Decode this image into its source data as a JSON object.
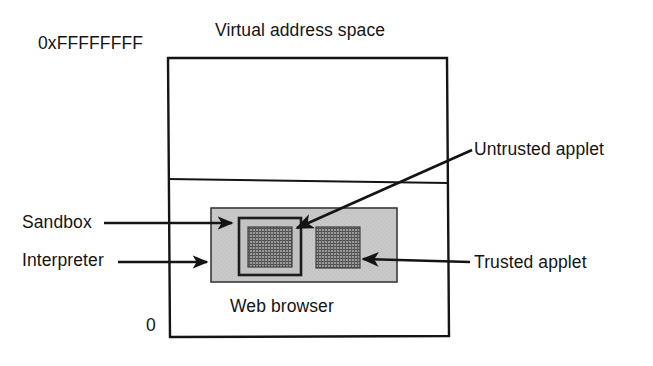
{
  "figure": {
    "title": "Virtual address space",
    "address_top": "0xFFFFFFFF",
    "address_bottom": "0",
    "region_label": "Web browser",
    "labels": {
      "sandbox": "Sandbox",
      "interpreter": "Interpreter",
      "untrusted_applet": "Untrusted applet",
      "trusted_applet": "Trusted applet"
    },
    "colors": {
      "line": "#141414",
      "interpreter_fill": "#c6c6c6",
      "sandbox_fill": "#b9b9b9",
      "applet_fill": "#8f8f8f",
      "applet_hatch": "#4a4a4a",
      "background": "#ffffff"
    }
  }
}
